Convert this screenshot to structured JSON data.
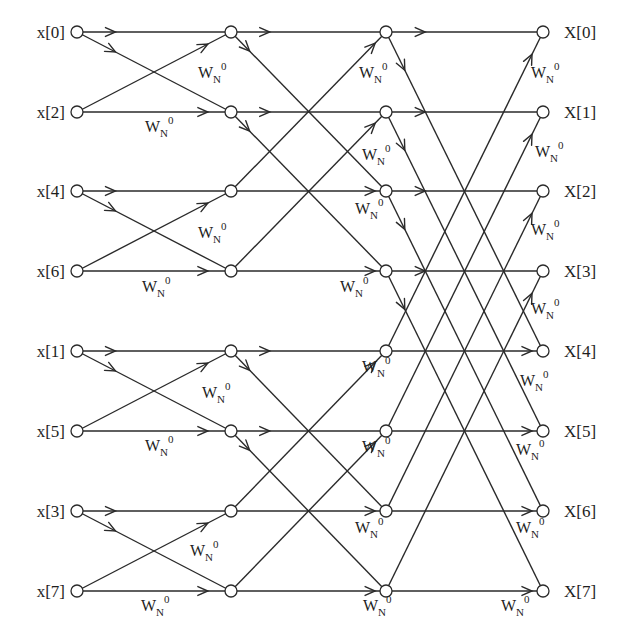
{
  "diagram": {
    "columns_x": [
      77,
      231,
      386,
      543
    ],
    "rows_y": [
      32,
      112,
      191,
      271,
      351,
      431,
      511,
      591
    ],
    "inputs": [
      "x[0]",
      "x[2]",
      "x[4]",
      "x[6]",
      "x[1]",
      "x[5]",
      "x[3]",
      "x[7]"
    ],
    "outputs": [
      "X[0]",
      "X[1]",
      "X[2]",
      "X[3]",
      "X[4]",
      "X[5]",
      "X[6]",
      "X[7]"
    ],
    "twiddle": {
      "base": "W",
      "subscript": "N",
      "superscript": "0"
    },
    "stages": [
      {
        "name": "stage-1",
        "pairs": [
          [
            0,
            1
          ],
          [
            2,
            3
          ],
          [
            4,
            5
          ],
          [
            6,
            7
          ]
        ]
      },
      {
        "name": "stage-2",
        "pairs": [
          [
            0,
            2
          ],
          [
            1,
            3
          ],
          [
            4,
            6
          ],
          [
            5,
            7
          ]
        ]
      },
      {
        "name": "stage-3",
        "pairs": [
          [
            0,
            4
          ],
          [
            1,
            5
          ],
          [
            2,
            6
          ],
          [
            3,
            7
          ]
        ]
      }
    ],
    "twiddle_labels": [
      {
        "x": 198,
        "y": 78
      },
      {
        "x": 145,
        "y": 132
      },
      {
        "x": 198,
        "y": 238
      },
      {
        "x": 142,
        "y": 292
      },
      {
        "x": 202,
        "y": 398
      },
      {
        "x": 145,
        "y": 451
      },
      {
        "x": 190,
        "y": 556
      },
      {
        "x": 141,
        "y": 611
      },
      {
        "x": 359,
        "y": 78
      },
      {
        "x": 362,
        "y": 160
      },
      {
        "x": 355,
        "y": 214
      },
      {
        "x": 340,
        "y": 292
      },
      {
        "x": 362,
        "y": 372
      },
      {
        "x": 362,
        "y": 452
      },
      {
        "x": 355,
        "y": 533
      },
      {
        "x": 363,
        "y": 611
      },
      {
        "x": 531,
        "y": 78
      },
      {
        "x": 535,
        "y": 157
      },
      {
        "x": 531,
        "y": 235
      },
      {
        "x": 531,
        "y": 314
      },
      {
        "x": 520,
        "y": 386
      },
      {
        "x": 516,
        "y": 455
      },
      {
        "x": 516,
        "y": 533
      },
      {
        "x": 501,
        "y": 611
      }
    ]
  }
}
